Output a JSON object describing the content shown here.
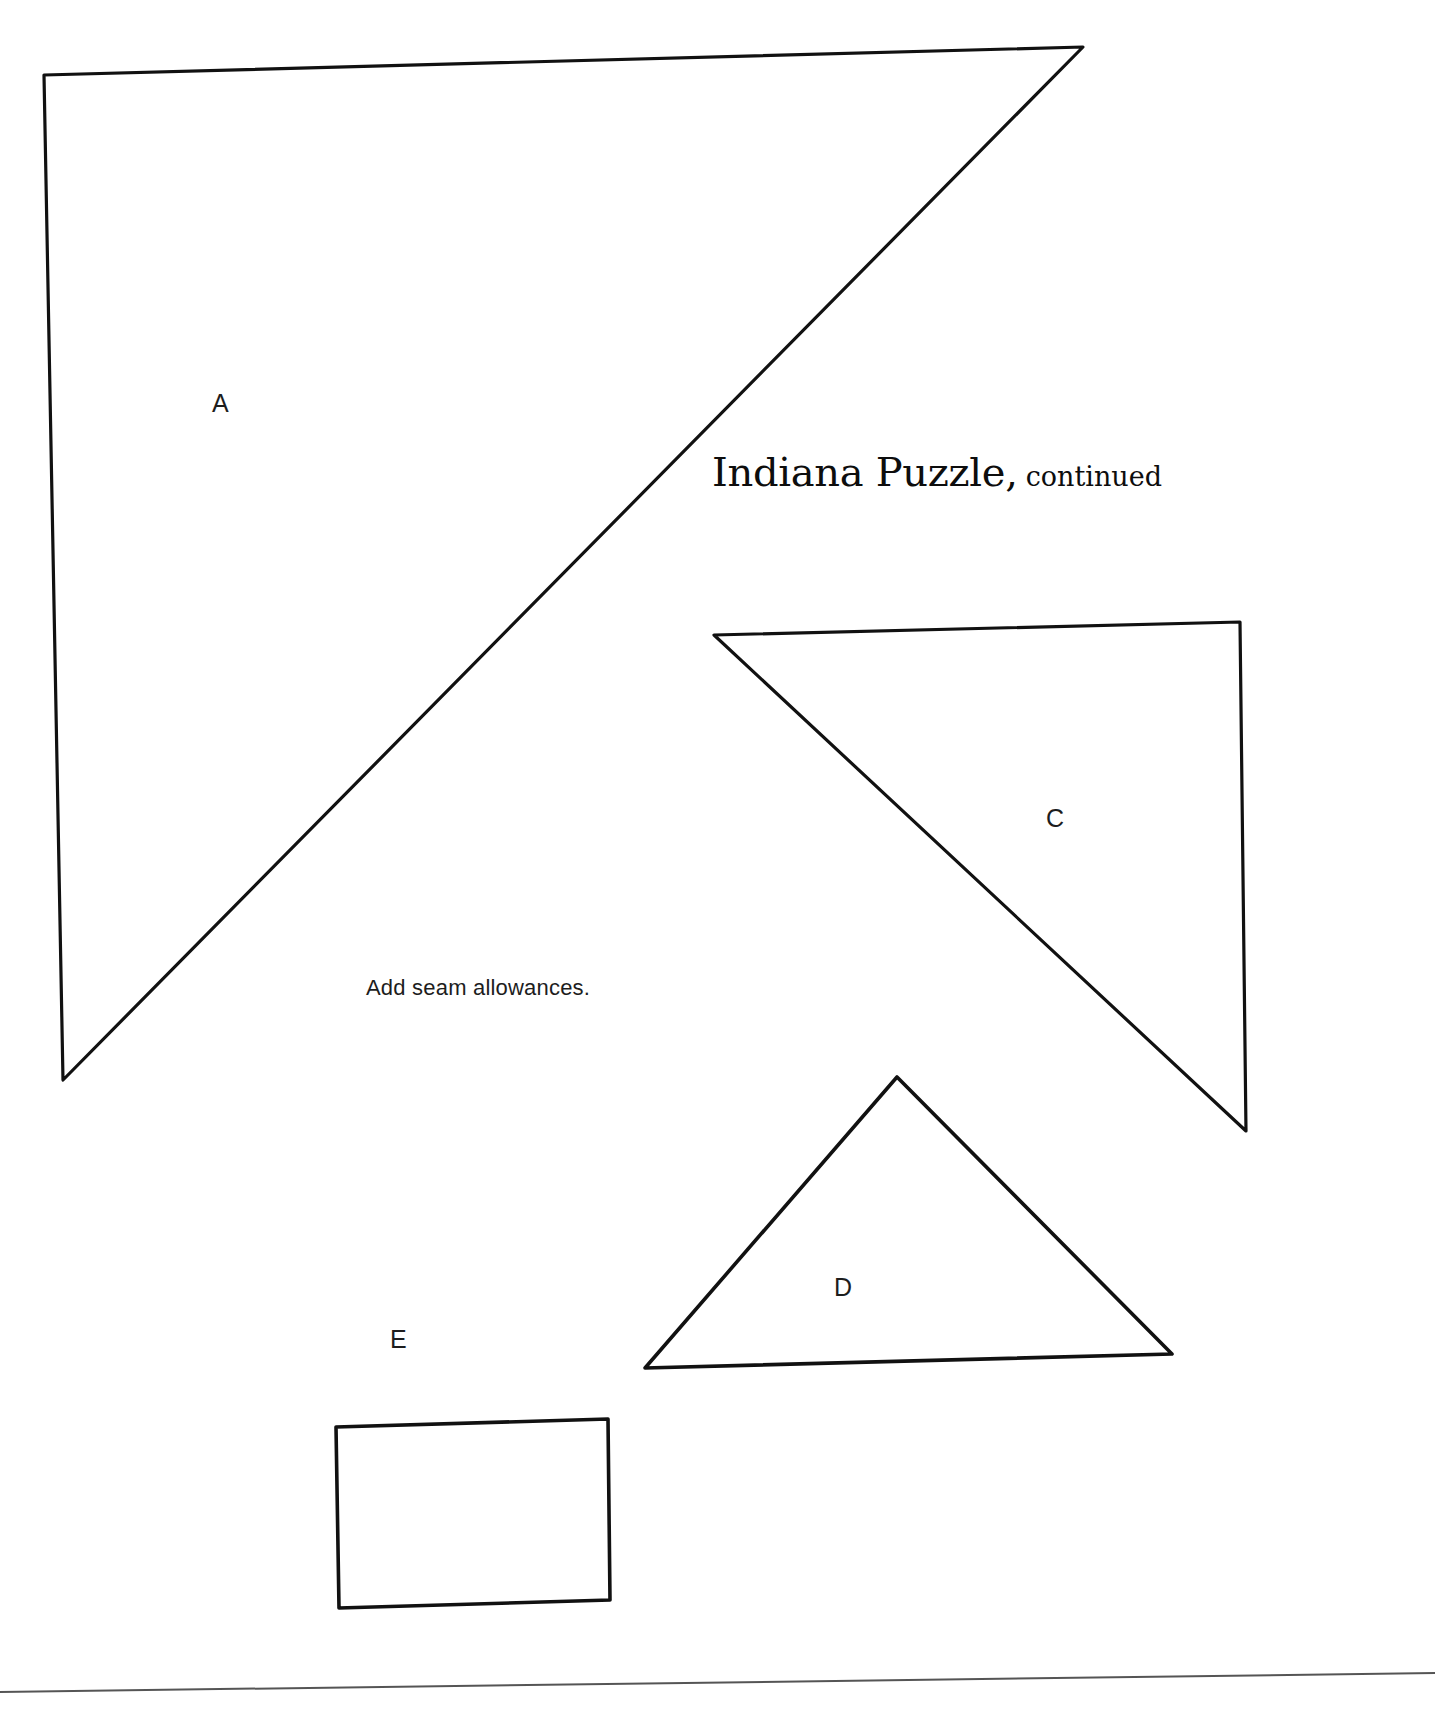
{
  "page": {
    "background_color": "#ffffff",
    "ink_color": "#111111",
    "width": 1435,
    "height": 1725
  },
  "title": {
    "main": "Indiana Puzzle,",
    "continued": "continued"
  },
  "note": {
    "seam_allowance": "Add seam allowances."
  },
  "pieces": [
    {
      "id": "A",
      "label": "A",
      "shape": "triangle",
      "description": "Large right triangle occupying the upper-left of the page",
      "points": "44,75 1083,47 63,1080"
    },
    {
      "id": "C",
      "label": "C",
      "shape": "triangle",
      "description": "Medium right triangle at mid-right of the page",
      "points": "714,635 1240,622 1246,1131"
    },
    {
      "id": "D",
      "label": "D",
      "shape": "triangle",
      "description": "Wide isoceles triangle near the bottom center-right",
      "points": "897,1077 1172,1354 645,1368"
    },
    {
      "id": "E",
      "label": "E",
      "shape": "square",
      "description": "Small square near the bottom left-center",
      "points": "336,1427 608,1419 610,1600 339,1608"
    }
  ],
  "footer_rule": {
    "description": "Thin horizontal rule across the bottom of the page",
    "points": "0,1692 1435,1673"
  },
  "chart_data": {
    "type": "table",
    "categories": [
      "A",
      "C",
      "D",
      "E"
    ],
    "values": [
      1,
      1,
      1,
      1
    ]
  }
}
